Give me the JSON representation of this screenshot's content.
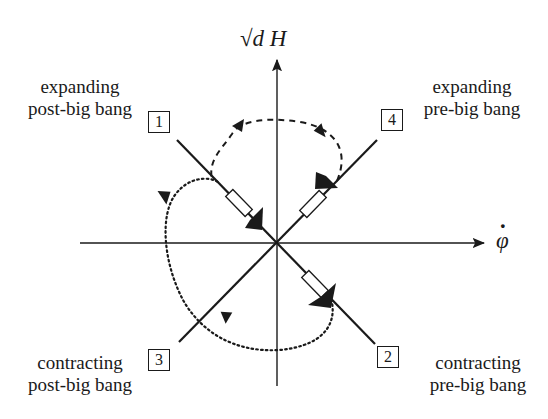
{
  "diagram": {
    "axes": {
      "y_label": "√d H",
      "x_label": "φ̇",
      "x_label_base": "φ",
      "x_label_dot": "·"
    },
    "quadrants": [
      {
        "number": "1",
        "line1": "expanding",
        "line2": "post-big bang"
      },
      {
        "number": "2",
        "line1": "contracting",
        "line2": "pre-big bang"
      },
      {
        "number": "3",
        "line1": "contracting",
        "line2": "post-big bang"
      },
      {
        "number": "4",
        "line1": "expanding",
        "line2": "pre-big bang"
      }
    ],
    "curves": [
      {
        "style": "dashed",
        "from_branch": "4",
        "to_branch": "1"
      },
      {
        "style": "dotted",
        "from_branch": "2",
        "to_branch": "3",
        "via": "1"
      }
    ],
    "colors": {
      "ink": "#1a1a1a",
      "background": "#ffffff"
    }
  }
}
